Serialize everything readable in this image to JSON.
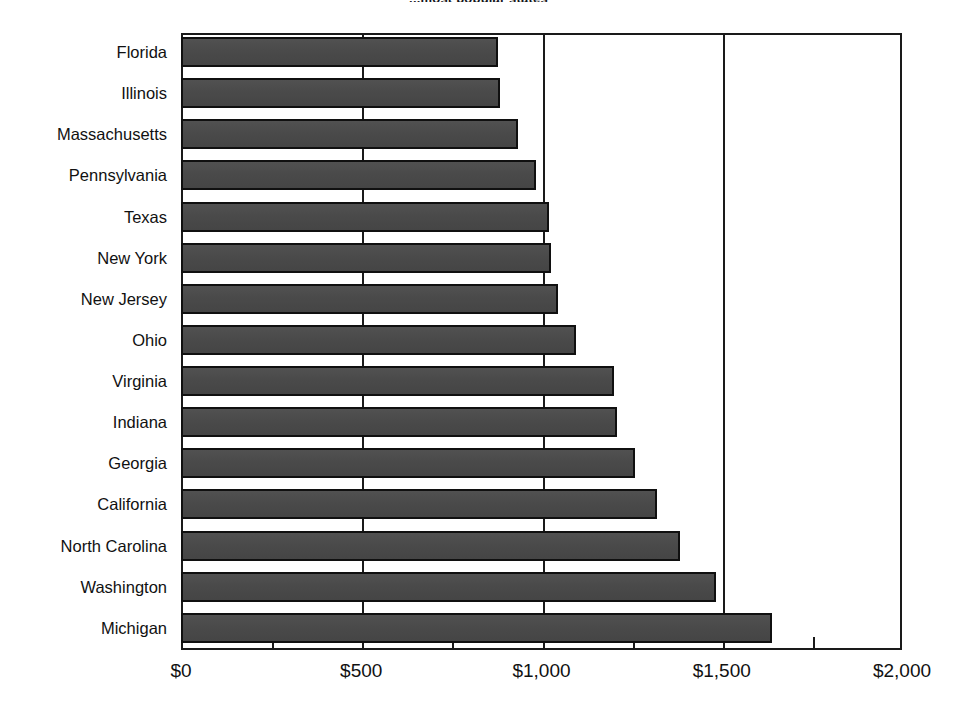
{
  "chart_data": {
    "type": "bar",
    "orientation": "horizontal",
    "title": "...most popular states",
    "xlabel": "",
    "ylabel": "",
    "xlim": [
      0,
      2000
    ],
    "grid": true,
    "legend": null,
    "currency_prefix": "$",
    "categories": [
      "Florida",
      "Illinois",
      "Massachusetts",
      "Pennsylvania",
      "Texas",
      "New York",
      "New Jersey",
      "Ohio",
      "Virginia",
      "Indiana",
      "Georgia",
      "California",
      "North Carolina",
      "Washington",
      "Michigan"
    ],
    "values": [
      880,
      885,
      935,
      985,
      1020,
      1025,
      1045,
      1095,
      1200,
      1210,
      1260,
      1320,
      1385,
      1485,
      1640
    ],
    "xticks": [
      0,
      500,
      1000,
      1500,
      2000
    ],
    "xticklabels": [
      "$0",
      "$500",
      "$1,000",
      "$1,500",
      "$2,000"
    ],
    "minor_xticks": [
      250,
      750,
      1250,
      1750
    ],
    "gridline_values": [
      500,
      1000,
      1500
    ],
    "bar_color": "#4b4b4b",
    "bar_border_color": "#101010",
    "axis_color": "#1a1a1a",
    "background": "#ffffff"
  }
}
